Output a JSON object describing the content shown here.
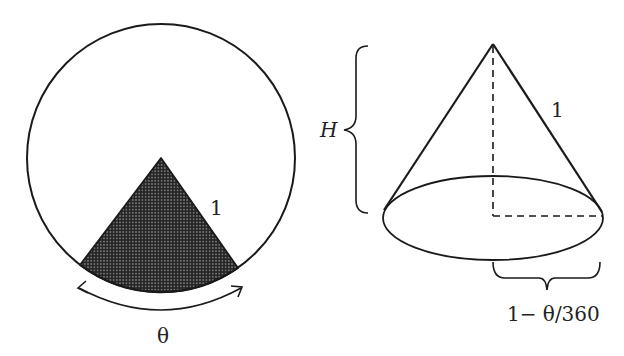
{
  "figure": {
    "left_panel": {
      "description": "Circle of radius 1 with a shaded sector of angle theta removed",
      "radius_label": "1",
      "angle_label": "θ"
    },
    "right_panel": {
      "description": "Cone formed from remaining sector",
      "slant_label": "1",
      "height_label": "H",
      "base_radius_label": "1− θ/360"
    },
    "colors": {
      "stroke": "#1a1a1a",
      "sector_fill": "#2a2a2a",
      "background": "#ffffff"
    }
  }
}
